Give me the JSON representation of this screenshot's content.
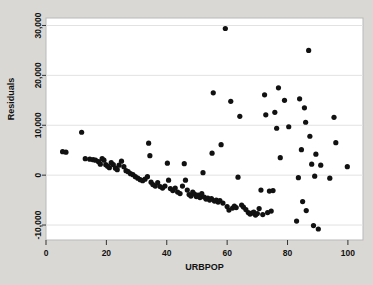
{
  "chart_data": {
    "type": "scatter",
    "title": "",
    "xlabel": "URBPOP",
    "ylabel": "Residuals",
    "xlim": [
      0,
      105
    ],
    "ylim": [
      -13000,
      31500
    ],
    "xticks": [
      0,
      20,
      40,
      60,
      80,
      100
    ],
    "xtick_labels": [
      "0",
      "20",
      "40",
      "60",
      "80",
      "100"
    ],
    "yticks": [
      -10000,
      0,
      10000,
      20000,
      30000
    ],
    "ytick_labels": [
      "-10,000",
      "0",
      "10,000",
      "20,000",
      "30,000"
    ],
    "grid": "horizontal",
    "legend": "none",
    "marker": "filled-circle",
    "marker_color": "#111111",
    "background_color": "#d9d8d4",
    "plot_area_color": "#ffffff",
    "points": [
      [
        5.5,
        4700
      ],
      [
        6.6,
        4600
      ],
      [
        11.8,
        8600
      ],
      [
        13.0,
        3300
      ],
      [
        14.5,
        3200
      ],
      [
        15.6,
        3100
      ],
      [
        16.4,
        3000
      ],
      [
        17.4,
        2700
      ],
      [
        18.0,
        2200
      ],
      [
        18.6,
        3300
      ],
      [
        19.2,
        3000
      ],
      [
        19.8,
        2100
      ],
      [
        20.4,
        1800
      ],
      [
        21.0,
        1500
      ],
      [
        21.6,
        2500
      ],
      [
        22.3,
        2100
      ],
      [
        23.0,
        1400
      ],
      [
        23.6,
        1100
      ],
      [
        24.2,
        2000
      ],
      [
        25.0,
        2800
      ],
      [
        25.8,
        1700
      ],
      [
        26.5,
        900
      ],
      [
        27.2,
        700
      ],
      [
        28.0,
        300
      ],
      [
        28.8,
        100
      ],
      [
        29.6,
        -300
      ],
      [
        30.4,
        -600
      ],
      [
        31.2,
        -900
      ],
      [
        32.0,
        -1100
      ],
      [
        32.8,
        -800
      ],
      [
        33.6,
        -300
      ],
      [
        34.0,
        6400
      ],
      [
        34.4,
        3900
      ],
      [
        34.8,
        -1400
      ],
      [
        35.4,
        -1900
      ],
      [
        36.2,
        -2200
      ],
      [
        37.0,
        -1500
      ],
      [
        37.8,
        -2300
      ],
      [
        38.6,
        -2600
      ],
      [
        39.4,
        -2200
      ],
      [
        40.2,
        2400
      ],
      [
        40.6,
        -1000
      ],
      [
        41.2,
        -2700
      ],
      [
        42.0,
        -3100
      ],
      [
        42.8,
        -2600
      ],
      [
        43.6,
        -3400
      ],
      [
        44.4,
        -3700
      ],
      [
        45.2,
        -2200
      ],
      [
        45.8,
        2300
      ],
      [
        46.2,
        -1000
      ],
      [
        46.8,
        -3000
      ],
      [
        47.4,
        -3900
      ],
      [
        48.0,
        -4200
      ],
      [
        48.6,
        -3400
      ],
      [
        49.2,
        -3800
      ],
      [
        49.8,
        -4300
      ],
      [
        50.4,
        -4000
      ],
      [
        51.0,
        -4500
      ],
      [
        51.6,
        -3700
      ],
      [
        52.0,
        500
      ],
      [
        52.4,
        -4400
      ],
      [
        53.0,
        -4800
      ],
      [
        53.6,
        -4600
      ],
      [
        54.2,
        -5000
      ],
      [
        54.8,
        -4700
      ],
      [
        55.0,
        4400
      ],
      [
        55.4,
        16500
      ],
      [
        55.8,
        -5200
      ],
      [
        56.4,
        -5000
      ],
      [
        57.0,
        -5400
      ],
      [
        57.6,
        -5100
      ],
      [
        58.0,
        6100
      ],
      [
        58.6,
        -5600
      ],
      [
        59.4,
        29400
      ],
      [
        60.0,
        -6300
      ],
      [
        60.6,
        -7000
      ],
      [
        61.2,
        14800
      ],
      [
        61.8,
        -6600
      ],
      [
        62.4,
        -6200
      ],
      [
        63.0,
        -6500
      ],
      [
        63.6,
        -400
      ],
      [
        64.2,
        11800
      ],
      [
        64.8,
        -6000
      ],
      [
        65.4,
        -6400
      ],
      [
        66.2,
        -6900
      ],
      [
        67.0,
        -7500
      ],
      [
        67.6,
        -7800
      ],
      [
        68.2,
        -7600
      ],
      [
        68.8,
        -7400
      ],
      [
        69.4,
        -8000
      ],
      [
        70.0,
        -7700
      ],
      [
        70.6,
        -6700
      ],
      [
        71.2,
        -3000
      ],
      [
        71.8,
        -7900
      ],
      [
        72.4,
        16100
      ],
      [
        72.8,
        12100
      ],
      [
        73.4,
        -7500
      ],
      [
        74.0,
        -3200
      ],
      [
        74.6,
        -7200
      ],
      [
        75.2,
        -3100
      ],
      [
        75.8,
        12600
      ],
      [
        76.4,
        9400
      ],
      [
        77.0,
        17500
      ],
      [
        77.6,
        3500
      ],
      [
        79.0,
        15000
      ],
      [
        80.4,
        9700
      ],
      [
        83.0,
        -9200
      ],
      [
        83.6,
        -500
      ],
      [
        84.0,
        15300
      ],
      [
        84.6,
        5100
      ],
      [
        85.0,
        -5300
      ],
      [
        85.6,
        13500
      ],
      [
        86.0,
        10600
      ],
      [
        86.2,
        -7100
      ],
      [
        87.0,
        25000
      ],
      [
        87.4,
        7800
      ],
      [
        88.0,
        2200
      ],
      [
        88.6,
        -10100
      ],
      [
        89.0,
        -200
      ],
      [
        89.4,
        4200
      ],
      [
        90.2,
        -10800
      ],
      [
        91.0,
        2000
      ],
      [
        94.0,
        -600
      ],
      [
        95.4,
        11600
      ],
      [
        96.0,
        6500
      ],
      [
        99.8,
        1700
      ]
    ]
  }
}
